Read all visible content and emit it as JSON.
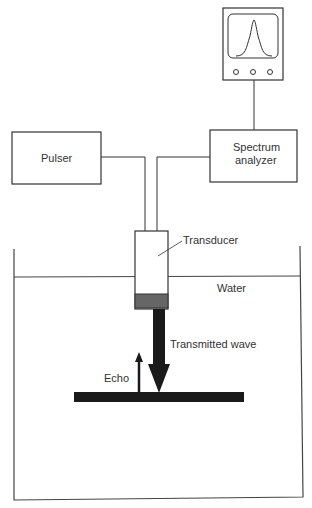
{
  "diagram": {
    "components": {
      "pulser": "Pulser",
      "spectrum_analyzer_line1": "Spectrum",
      "spectrum_analyzer_line2": "analyzer",
      "transducer": "Transducer",
      "water": "Water",
      "transmitted_wave": "Transmitted wave",
      "echo": "Echo"
    },
    "colors": {
      "line": "#333333",
      "reflector": "#1a1a1a",
      "transducer_element": "#666666"
    }
  }
}
